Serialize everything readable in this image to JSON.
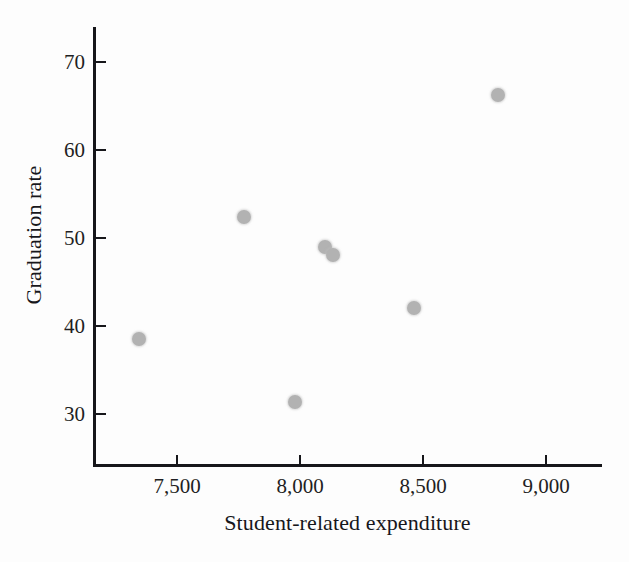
{
  "chart_data": {
    "type": "scatter",
    "title": "",
    "xlabel": "Student-related expenditure",
    "ylabel": "Graduation rate",
    "xlim": [
      7230,
      9090
    ],
    "ylim": [
      26.5,
      73.5
    ],
    "xticks": [
      7500,
      8000,
      8500,
      9000
    ],
    "xtick_labels": [
      "7,500",
      "8,000",
      "8,500",
      "9,000"
    ],
    "yticks": [
      30,
      40,
      50,
      60,
      70
    ],
    "ytick_labels": [
      "30",
      "40",
      "50",
      "60",
      "70"
    ],
    "grid": false,
    "legend": null,
    "marker_color": "#b2b2b2",
    "axis_color": "#16161a",
    "points": [
      {
        "x": 7345,
        "y": 38.5
      },
      {
        "x": 7772,
        "y": 52.4
      },
      {
        "x": 7980,
        "y": 31.4
      },
      {
        "x": 8102,
        "y": 49.0
      },
      {
        "x": 8134,
        "y": 48.1
      },
      {
        "x": 8463,
        "y": 42.1
      },
      {
        "x": 8805,
        "y": 66.3
      }
    ]
  }
}
